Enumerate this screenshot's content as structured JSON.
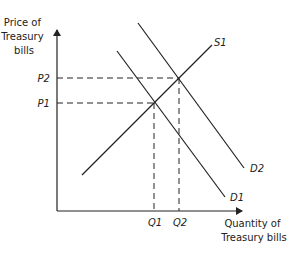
{
  "diagram": {
    "type": "supply-demand",
    "y_axis": {
      "label_lines": [
        "Price of",
        "Treasury",
        "bills"
      ]
    },
    "x_axis": {
      "label_lines": [
        "Quantity of",
        "Treasury bills"
      ]
    },
    "price_ticks": [
      {
        "label": "P2"
      },
      {
        "label": "P1"
      }
    ],
    "quantity_ticks": [
      {
        "label": "Q1"
      },
      {
        "label": "Q2"
      }
    ],
    "curves": [
      {
        "name": "S1",
        "kind": "supply"
      },
      {
        "name": "D1",
        "kind": "demand"
      },
      {
        "name": "D2",
        "kind": "demand"
      }
    ],
    "equilibria": [
      {
        "price": "P1",
        "quantity": "Q1",
        "curves": [
          "S1",
          "D1"
        ]
      },
      {
        "price": "P2",
        "quantity": "Q2",
        "curves": [
          "S1",
          "D2"
        ]
      }
    ],
    "colors": {
      "line": "#222222",
      "background": "#ffffff"
    }
  }
}
